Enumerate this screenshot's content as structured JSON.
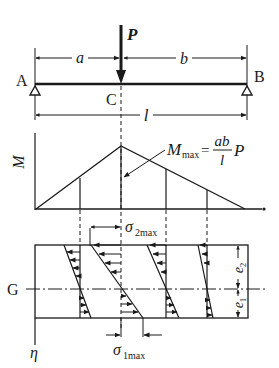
{
  "diagram": {
    "beam": {
      "load_label": "P",
      "support_left_label": "A",
      "support_right_label": "B",
      "load_point_label": "C",
      "dim_left_label": "a",
      "dim_right_label": "b",
      "span_label": "l"
    },
    "moment_diagram": {
      "axis_label": "M",
      "max_label_main": "M",
      "max_label_sub": "max",
      "equals": "=",
      "fraction_numerator": "ab",
      "fraction_denominator": "l",
      "fraction_factor": "P"
    },
    "stress_diagram": {
      "neutral_axis_label": "G",
      "vertical_axis_label": "η",
      "sigma2_main": "σ",
      "sigma2_sub": "2max",
      "sigma1_main": "σ",
      "sigma1_sub": "1max",
      "e2_main": "e",
      "e2_sub": "2",
      "e1_main": "e",
      "e1_sub": "1"
    },
    "colors": {
      "ink": "#1a1a1a",
      "background": "#ffffff"
    }
  }
}
